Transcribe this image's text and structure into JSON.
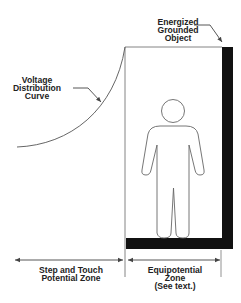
{
  "diagram": {
    "labels": {
      "energized_object": [
        "Energized",
        "Grounded",
        "Object"
      ],
      "voltage_curve": [
        "Voltage",
        "Distribution",
        "Curve"
      ],
      "step_touch_zone": [
        "Step and Touch",
        "Potential Zone"
      ],
      "equipotential_zone": [
        "Equipotential",
        "Zone",
        "(See text.)"
      ]
    },
    "colors": {
      "background": "#ffffff",
      "line": "#555555",
      "fill_dark": "#111111",
      "text": "#222222"
    },
    "elements": {
      "curve": "voltage-distribution-curve",
      "person": "person-figure",
      "grounded_object": "energized-grounded-object-bars"
    }
  }
}
